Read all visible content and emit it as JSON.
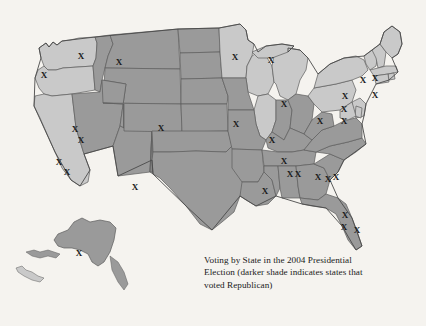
{
  "figure": {
    "name": "us-election-map-2004",
    "background_color": "#f5f3ef",
    "caption_line1": "Voting by State in the 2004 Presidential",
    "caption_line2": "Election (darker shade indicates states that",
    "caption_line3": "voted Republican)",
    "caption_full": "Voting by State in the 2004 Presidential Election (darker shade indicates states that voted Republican)"
  },
  "legend": {
    "dark_shade_meaning": "voted Republican",
    "light_shade_meaning": "voted Democratic",
    "marker_glyph": "X",
    "marker_meaning": "electoral vote tally mark"
  },
  "colors": {
    "republican_dark": "#9a9a9a",
    "democratic_light": "#c9c9c9",
    "border_stroke": "#5d5d5d",
    "outline_stroke": "#4a4a4a",
    "marker_color": "#1a1a1a",
    "background": "#f5f3ef",
    "caption_text": "#1b1b1b"
  },
  "chart_data": {
    "type": "map",
    "title": "Voting by State in the 2004 Presidential Election",
    "subtitle": "darker shade indicates states that voted Republican",
    "region": "United States",
    "categories": [
      "Republican",
      "Democratic"
    ],
    "series": [
      {
        "name": "Republican",
        "shade": "#9a9a9a",
        "states": [
          "Montana",
          "Idaho",
          "Wyoming",
          "Utah",
          "Nevada",
          "Arizona",
          "New Mexico",
          "Colorado",
          "North Dakota",
          "South Dakota",
          "Nebraska",
          "Kansas",
          "Oklahoma",
          "Texas",
          "Missouri",
          "Arkansas",
          "Louisiana",
          "Mississippi",
          "Alabama",
          "Tennessee",
          "Kentucky",
          "Indiana",
          "Ohio",
          "West Virginia",
          "Virginia",
          "North Carolina",
          "South Carolina",
          "Georgia",
          "Florida",
          "Iowa",
          "Alaska"
        ]
      },
      {
        "name": "Democratic",
        "shade": "#c9c9c9",
        "states": [
          "Washington",
          "Oregon",
          "California",
          "Minnesota",
          "Wisconsin",
          "Michigan",
          "Illinois",
          "Pennsylvania",
          "New York",
          "Vermont",
          "New Hampshire",
          "Maine",
          "Massachusetts",
          "Rhode Island",
          "Connecticut",
          "New Jersey",
          "Delaware",
          "Maryland",
          "District of Columbia",
          "Hawaii"
        ]
      }
    ],
    "markers": [
      {
        "label": "X",
        "x": 44,
        "y": 76
      },
      {
        "label": "X",
        "x": 81,
        "y": 57
      },
      {
        "label": "X",
        "x": 119,
        "y": 63
      },
      {
        "label": "X",
        "x": 75,
        "y": 130
      },
      {
        "label": "X",
        "x": 81,
        "y": 141
      },
      {
        "label": "X",
        "x": 59,
        "y": 163
      },
      {
        "label": "X",
        "x": 67,
        "y": 173
      },
      {
        "label": "X",
        "x": 161,
        "y": 129
      },
      {
        "label": "X",
        "x": 135,
        "y": 188
      },
      {
        "label": "X",
        "x": 236,
        "y": 125
      },
      {
        "label": "X",
        "x": 235,
        "y": 58
      },
      {
        "label": "X",
        "x": 271,
        "y": 61
      },
      {
        "label": "X",
        "x": 284,
        "y": 105
      },
      {
        "label": "X",
        "x": 272,
        "y": 141
      },
      {
        "label": "X",
        "x": 284,
        "y": 162
      },
      {
        "label": "X",
        "x": 265,
        "y": 192
      },
      {
        "label": "X",
        "x": 290,
        "y": 175
      },
      {
        "label": "X",
        "x": 298,
        "y": 175
      },
      {
        "label": "X",
        "x": 318,
        "y": 178
      },
      {
        "label": "X",
        "x": 328,
        "y": 180
      },
      {
        "label": "X",
        "x": 336,
        "y": 178
      },
      {
        "label": "X",
        "x": 320,
        "y": 122
      },
      {
        "label": "X",
        "x": 344,
        "y": 110
      },
      {
        "label": "X",
        "x": 344,
        "y": 122
      },
      {
        "label": "X",
        "x": 375,
        "y": 96
      },
      {
        "label": "X",
        "x": 345,
        "y": 216
      },
      {
        "label": "X",
        "x": 344,
        "y": 228
      },
      {
        "label": "X",
        "x": 357,
        "y": 231
      },
      {
        "label": "X",
        "x": 345,
        "y": 97
      },
      {
        "label": "X",
        "x": 363,
        "y": 81
      },
      {
        "label": "X",
        "x": 375,
        "y": 79
      },
      {
        "label": "X",
        "x": 79,
        "y": 254
      }
    ],
    "marker_count": 32,
    "grid": false,
    "legend_position": "below-right"
  }
}
